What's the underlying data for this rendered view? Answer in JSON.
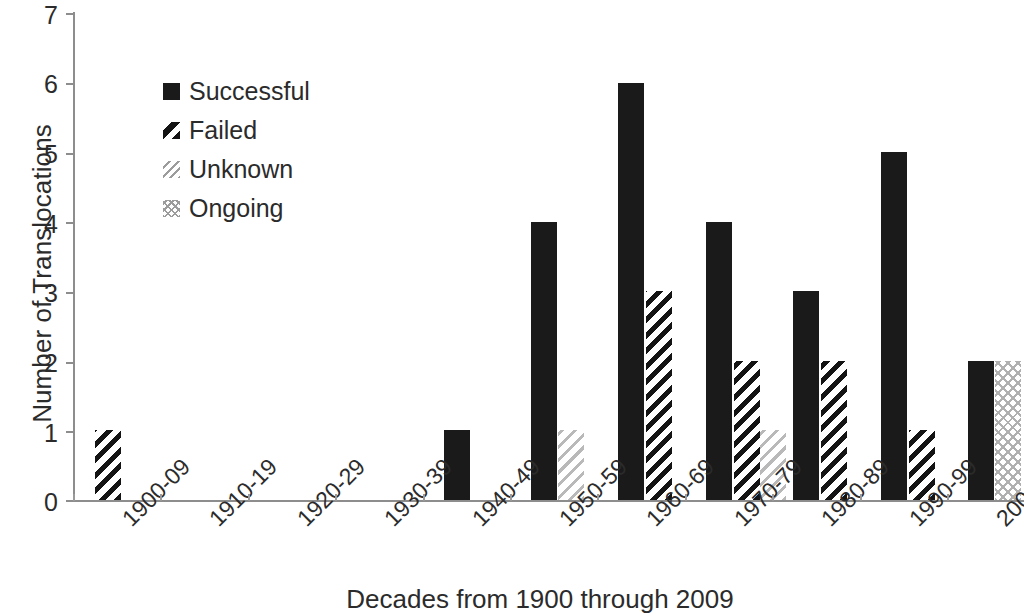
{
  "chart_data": {
    "type": "bar",
    "title": "",
    "xlabel": "Decades from 1900 through 2009",
    "ylabel": "Number of Translocations",
    "categories": [
      "1900-09",
      "1910-19",
      "1920-29",
      "1930-39",
      "1940-49",
      "1950-59",
      "1960-69",
      "1970-79",
      "1980-89",
      "1990-99",
      "2000-09"
    ],
    "series": [
      {
        "name": "Successful",
        "pattern": "solid-black",
        "values": [
          0,
          0,
          0,
          0,
          1,
          4,
          6,
          4,
          3,
          5,
          2
        ]
      },
      {
        "name": "Failed",
        "pattern": "diagonal-stripe-black",
        "values": [
          1,
          0,
          0,
          0,
          0,
          0,
          3,
          2,
          2,
          1,
          0
        ]
      },
      {
        "name": "Unknown",
        "pattern": "light-diagonal-hatch",
        "values": [
          0,
          0,
          0,
          0,
          0,
          1,
          0,
          1,
          0,
          0,
          0
        ]
      },
      {
        "name": "Ongoing",
        "pattern": "light-cross-hatch",
        "values": [
          0,
          0,
          0,
          0,
          0,
          0,
          0,
          0,
          0,
          0,
          2
        ]
      }
    ],
    "ylim": [
      0,
      7
    ],
    "yticks": [
      0,
      1,
      2,
      3,
      4,
      5,
      6,
      7
    ],
    "grid": false,
    "legend_position": "upper-left-inside",
    "xtick_rotation": -45
  },
  "legend": {
    "items": [
      {
        "label": "Successful",
        "key": "solid-square-key"
      },
      {
        "label": "Failed",
        "key": "diagonal-stripe-key"
      },
      {
        "label": "Unknown",
        "key": "light-hatch-key"
      },
      {
        "label": "Ongoing",
        "key": "cross-hatch-key"
      }
    ]
  },
  "axes": {
    "y_title": "Number of Translocations",
    "x_title": "Decades from 1900 through 2009",
    "y_tick_labels": [
      "7",
      "6",
      "5",
      "4",
      "3",
      "2",
      "1",
      "0"
    ],
    "x_tick_labels": [
      "1900-09",
      "1910-19",
      "1920-29",
      "1930-39",
      "1940-49",
      "1950-59",
      "1960-69",
      "1970-79",
      "1980-89",
      "1990-99",
      "2000-09"
    ]
  },
  "colors": {
    "bar_solid": "#1a1a1a",
    "axis": "#8d8d8d",
    "text": "#2b2b2b",
    "hatch_light": "#b9b9b9",
    "background": "#ffffff"
  }
}
